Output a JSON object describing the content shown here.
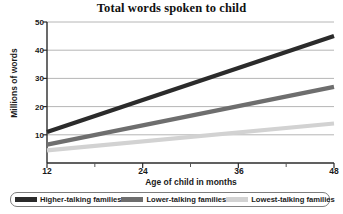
{
  "chart_data": {
    "type": "line",
    "title": "Total words spoken to child",
    "xlabel": "Age of child in months",
    "ylabel": "Millions of words",
    "x": [
      12,
      48
    ],
    "xlim": [
      12,
      48
    ],
    "ylim": [
      0,
      50
    ],
    "xticks": [
      12,
      24,
      36,
      48
    ],
    "xticks_minor": [
      18,
      30,
      42
    ],
    "yticks": [
      10,
      20,
      30,
      40,
      50
    ],
    "grid": "horizontal",
    "legend_position": "bottom",
    "series": [
      {
        "name": "Higher-talking families",
        "color": "#2b2b2b",
        "values": [
          11,
          45
        ]
      },
      {
        "name": "Lower-talking families",
        "color": "#6e6e6e",
        "values": [
          6.5,
          27
        ]
      },
      {
        "name": "Lowest-talking families",
        "color": "#d2d2d2",
        "values": [
          4.5,
          14
        ]
      }
    ]
  },
  "axis": {
    "y_tick_labels": [
      "50",
      "40",
      "30",
      "20",
      "10"
    ],
    "x_tick_labels": [
      "12",
      "24",
      "36",
      "48"
    ]
  },
  "legend": {
    "items": [
      {
        "label": "Higher-talking families",
        "color": "#2b2b2b"
      },
      {
        "label": "Lower-talking families",
        "color": "#6e6e6e"
      },
      {
        "label": "Lowest-talking families",
        "color": "#d2d2d2"
      }
    ]
  }
}
